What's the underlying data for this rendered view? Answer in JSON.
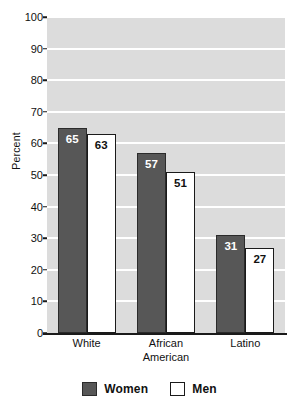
{
  "chart_data": {
    "type": "bar",
    "title": "",
    "subtitle": "",
    "xlabel": "",
    "ylabel": "Percent",
    "ylim": [
      0,
      100
    ],
    "ytick_step": 10,
    "yticks": [
      "0",
      "10",
      "20",
      "30",
      "40",
      "50",
      "60",
      "70",
      "80",
      "90",
      "100"
    ],
    "grid": true,
    "grid_axis": "y",
    "grid_color": "#ffffff",
    "plot_background": "#dcdcdc",
    "legend_position": "bottom-center",
    "categories": [
      "White",
      "African American",
      "Latino"
    ],
    "category_lines": [
      [
        "White"
      ],
      [
        "African",
        "American"
      ],
      [
        "Latino"
      ]
    ],
    "series": [
      {
        "name": "Women",
        "color": "#575757",
        "border_color": "#2b2b2b",
        "label_color": "#ffffff",
        "values": [
          65,
          57,
          31
        ]
      },
      {
        "name": "Men",
        "color": "#ffffff",
        "border_color": "#1a1a1a",
        "label_color": "#111111",
        "values": [
          63,
          51,
          27
        ]
      }
    ],
    "value_labels": {
      "White": {
        "Women": "65",
        "Men": "63"
      },
      "African American": {
        "Women": "57",
        "Men": "51"
      },
      "Latino": {
        "Women": "31",
        "Men": "27"
      }
    }
  },
  "legend": {
    "items": [
      {
        "label": "Women",
        "swatch": "women-swatch"
      },
      {
        "label": "Men",
        "swatch": "men-swatch"
      }
    ]
  },
  "axes": {
    "y_title": "Percent"
  }
}
